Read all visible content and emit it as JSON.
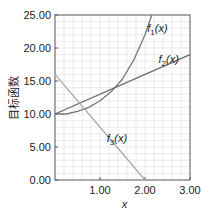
{
  "chart_data": {
    "type": "line",
    "title": "",
    "xlabel": "x",
    "ylabel": "目标函数",
    "xlim": [
      0,
      3
    ],
    "ylim": [
      0,
      25
    ],
    "grid": true,
    "x_ticks": [
      "1.00",
      "2.00",
      "3.00"
    ],
    "y_ticks": [
      "0.00",
      "5.00",
      "10.00",
      "15.00",
      "20.00",
      "25.00"
    ],
    "series": [
      {
        "name": "f1(x)",
        "x": [
          0,
          0.25,
          0.5,
          0.75,
          1.0,
          1.25,
          1.5,
          1.75,
          2.0,
          2.15
        ],
        "y": [
          10,
          10,
          10.4,
          11.0,
          12.0,
          13.4,
          15.3,
          18.2,
          22.0,
          25.0
        ]
      },
      {
        "name": "f2(x)",
        "x": [
          0,
          3
        ],
        "y": [
          10,
          19
        ]
      },
      {
        "name": "f3(x)",
        "x": [
          0,
          2
        ],
        "y": [
          16,
          0
        ]
      }
    ],
    "annotations": [
      {
        "text": "f1(x)",
        "x": 2.05,
        "y": 22.5
      },
      {
        "text": "f2(x)",
        "x": 2.3,
        "y": 17.8
      },
      {
        "text": "f3(x)",
        "x": 1.15,
        "y": 5.8
      }
    ],
    "legend": "inline labels"
  },
  "labels": {
    "xlabel": "x",
    "ylabel": "目标函数",
    "f1": "f1(x)",
    "f2": "f2(x)",
    "f3": "f3(x)"
  }
}
